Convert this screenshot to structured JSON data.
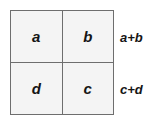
{
  "diagram": {
    "type": "2x2-grid-with-row-sums",
    "grid": {
      "rows": [
        {
          "cells": [
            {
              "label": "a"
            },
            {
              "label": "b"
            }
          ],
          "sum_label": "a+b"
        },
        {
          "cells": [
            {
              "label": "d"
            },
            {
              "label": "c"
            }
          ],
          "sum_label": "c+d"
        }
      ]
    },
    "colors": {
      "cell_fill": "#f4f4f4",
      "cell_border": "#6e6e6e",
      "outer_border": "#8c8c8c",
      "text": "#151515",
      "background": "#ffffff"
    }
  }
}
